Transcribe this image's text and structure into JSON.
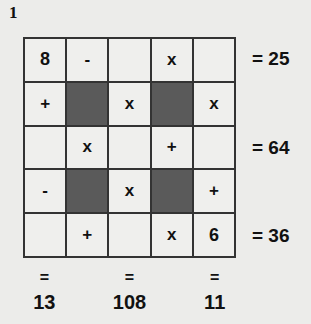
{
  "puzzle": {
    "number": "1",
    "colors": {
      "background": "#ececea",
      "cell": "#efefed",
      "blocked_cell": "#5a5a5a",
      "grid_line": "#333333",
      "text": "#111111"
    },
    "grid": [
      [
        {
          "v": "8",
          "dark": false
        },
        {
          "v": "-",
          "dark": false
        },
        {
          "v": "",
          "dark": false
        },
        {
          "v": "x",
          "dark": false
        },
        {
          "v": "",
          "dark": false
        }
      ],
      [
        {
          "v": "+",
          "dark": false
        },
        {
          "v": "",
          "dark": true
        },
        {
          "v": "x",
          "dark": false
        },
        {
          "v": "",
          "dark": true
        },
        {
          "v": "x",
          "dark": false
        }
      ],
      [
        {
          "v": "",
          "dark": false
        },
        {
          "v": "x",
          "dark": false
        },
        {
          "v": "",
          "dark": false
        },
        {
          "v": "+",
          "dark": false
        },
        {
          "v": "",
          "dark": false
        }
      ],
      [
        {
          "v": "-",
          "dark": false
        },
        {
          "v": "",
          "dark": true
        },
        {
          "v": "x",
          "dark": false
        },
        {
          "v": "",
          "dark": true
        },
        {
          "v": "+",
          "dark": false
        }
      ],
      [
        {
          "v": "",
          "dark": false
        },
        {
          "v": "+",
          "dark": false
        },
        {
          "v": "",
          "dark": false
        },
        {
          "v": "x",
          "dark": false
        },
        {
          "v": "6",
          "dark": false
        }
      ]
    ],
    "row_results": [
      {
        "row": 0,
        "text": "= 25"
      },
      {
        "row": 2,
        "text": "= 64"
      },
      {
        "row": 4,
        "text": "= 36"
      }
    ],
    "col_results": [
      {
        "col": 0,
        "eq": "=",
        "value": "13"
      },
      {
        "col": 2,
        "eq": "=",
        "value": "108"
      },
      {
        "col": 4,
        "eq": "=",
        "value": "11"
      }
    ]
  }
}
